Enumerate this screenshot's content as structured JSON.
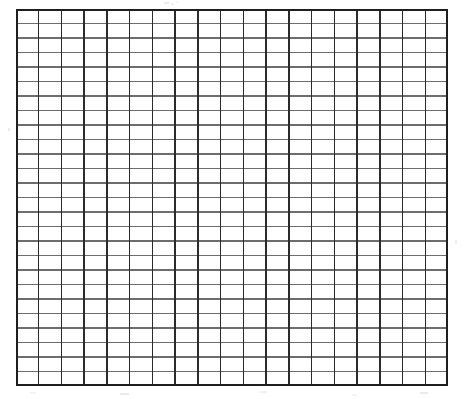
{
  "page": {
    "width": 468,
    "height": 399,
    "background_color": "#ffffff",
    "caption": ""
  },
  "grid": {
    "name": "blank-grid",
    "x": 16,
    "y": 9,
    "width": 432,
    "height": 377,
    "columns": 19,
    "rows": 26,
    "cell_width": 22.74,
    "cell_height": 14.5,
    "vertical_line_color": "#2b2b2b",
    "horizontal_line_color": "#6d6d6d",
    "border_color": "#1f1f1f",
    "vertical_line_width": 1.5,
    "horizontal_line_width": 1.1,
    "border_width": 1.6,
    "fill_color": "#ffffff"
  },
  "artifacts": {
    "speckles": [
      {
        "x": 164,
        "y": 2,
        "width": 5,
        "height": 2
      },
      {
        "x": 171,
        "y": 3,
        "width": 3,
        "height": 2
      },
      {
        "x": 176,
        "y": 1,
        "width": 2,
        "height": 2
      },
      {
        "x": 8,
        "y": 128,
        "width": 2,
        "height": 3
      },
      {
        "x": 455,
        "y": 240,
        "width": 2,
        "height": 4
      },
      {
        "x": 30,
        "y": 392,
        "width": 6,
        "height": 2
      },
      {
        "x": 120,
        "y": 393,
        "width": 9,
        "height": 2
      },
      {
        "x": 260,
        "y": 391,
        "width": 7,
        "height": 2
      },
      {
        "x": 352,
        "y": 394,
        "width": 5,
        "height": 2
      },
      {
        "x": 420,
        "y": 392,
        "width": 8,
        "height": 2
      }
    ]
  },
  "chart_data": {
    "type": "table",
    "title": "",
    "subtitle": "",
    "xlabel": "",
    "ylabel": "",
    "legend": [],
    "annotations": [],
    "grid": true,
    "columns": 19,
    "rows": 26,
    "cells_total": 494,
    "values": []
  }
}
